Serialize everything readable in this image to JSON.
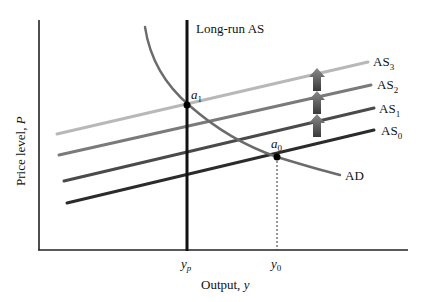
{
  "diagram": {
    "type": "economics-ad-as",
    "axes": {
      "y_label": "Price level, ",
      "y_label_var": "P",
      "x_label": "Output, ",
      "x_label_var": "y"
    },
    "x_ticks": [
      {
        "id": "yp",
        "base": "y",
        "sub": "p"
      },
      {
        "id": "y0",
        "base": "y",
        "sub": "0"
      }
    ],
    "long_run_as": {
      "label": "Long-run AS"
    },
    "ad": {
      "label": "AD",
      "color": "#6b6b6b"
    },
    "as_curves": [
      {
        "base": "AS",
        "sub": "0",
        "color": "#2b2b2b"
      },
      {
        "base": "AS",
        "sub": "1",
        "color": "#4a4a4a"
      },
      {
        "base": "AS",
        "sub": "2",
        "color": "#7a7a7a"
      },
      {
        "base": "AS",
        "sub": "3",
        "color": "#b8b8b8"
      }
    ],
    "points": [
      {
        "id": "a0",
        "base": "a",
        "sub": "0"
      },
      {
        "id": "a1",
        "base": "a",
        "sub": "1"
      }
    ],
    "shift_arrows": {
      "count": 3,
      "direction": "up",
      "meaning": "AS shifts upward"
    }
  }
}
